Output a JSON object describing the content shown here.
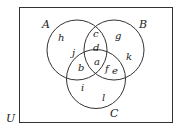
{
  "diagram": {
    "type": "venn",
    "universe": {
      "label": "U"
    },
    "sets": [
      {
        "id": "A",
        "label": "A"
      },
      {
        "id": "B",
        "label": "B"
      },
      {
        "id": "C",
        "label": "C"
      }
    ],
    "regions": {
      "A_only": [
        "h",
        "j"
      ],
      "B_only": [
        "g",
        "k"
      ],
      "C_only": [
        "i",
        "l"
      ],
      "A_and_B_only": [
        "c",
        "d"
      ],
      "A_and_C_only": [
        "b"
      ],
      "B_and_C_only": [
        "f",
        "e"
      ],
      "A_and_B_and_C": [
        "a"
      ]
    },
    "labels": {
      "U": "U",
      "A": "A",
      "B": "B",
      "C": "C",
      "h": "h",
      "j": "j",
      "c": "c",
      "d": "d",
      "g": "g",
      "k": "k",
      "b": "b",
      "a": "a",
      "f": "f",
      "e": "e",
      "i": "i",
      "l": "l"
    }
  }
}
